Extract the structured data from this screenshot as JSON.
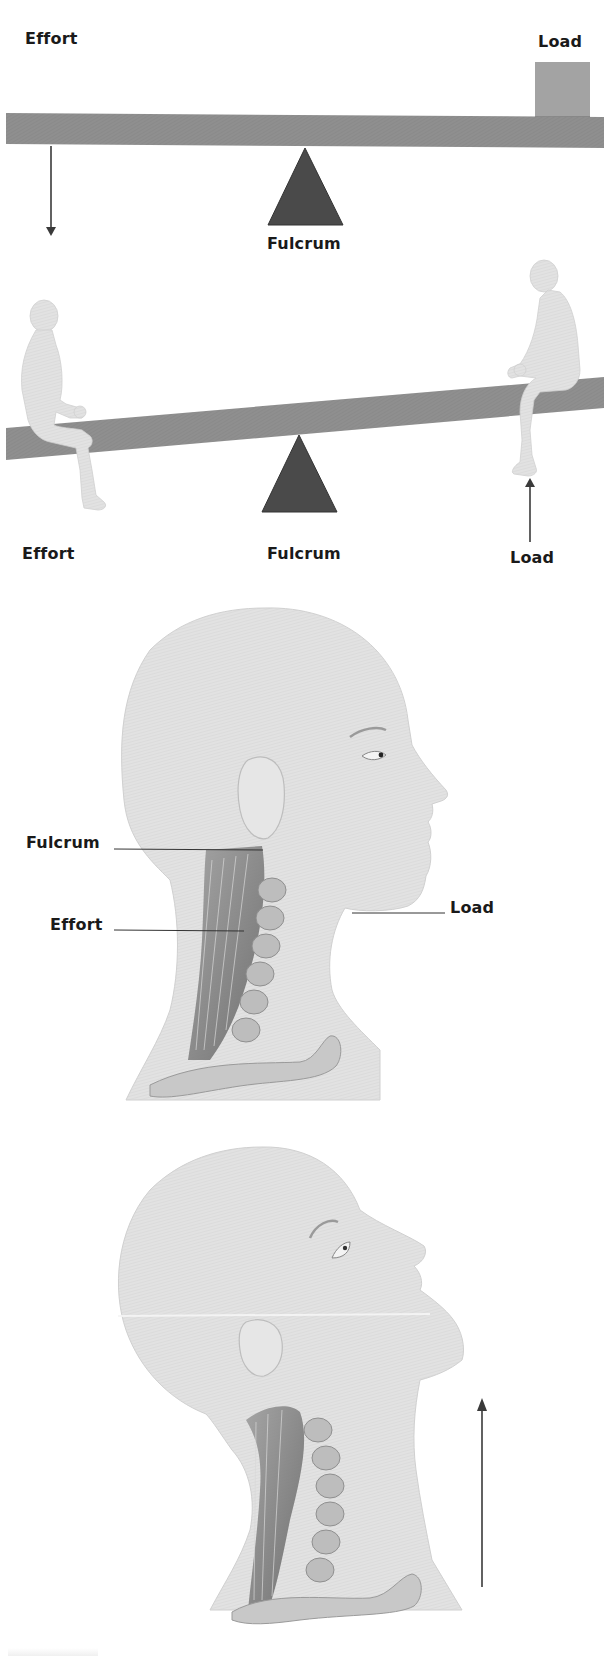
{
  "figure": {
    "panels": [
      {
        "id": "lever-simple",
        "labels": {
          "effort": "Effort",
          "load": "Load",
          "fulcrum": "Fulcrum"
        },
        "effort_arrow_direction": "down"
      },
      {
        "id": "lever-seesaw",
        "labels": {
          "effort": "Effort",
          "fulcrum": "Fulcrum",
          "load": "Load"
        },
        "load_arrow_direction": "up"
      },
      {
        "id": "head-lever-neutral",
        "labels": {
          "fulcrum": "Fulcrum",
          "effort": "Effort",
          "load": "Load"
        }
      },
      {
        "id": "head-lever-extended",
        "labels": {},
        "arrow_direction": "up"
      }
    ]
  },
  "colors": {
    "beam": "#8c8c8c",
    "fulcrum": "#4a4a4a",
    "load_box": "#a3a3a3",
    "arrow": "#3a3a3a",
    "skin": "#e4e4e4",
    "muscle": "#6e6e6e",
    "text": "#1a1a1a"
  }
}
